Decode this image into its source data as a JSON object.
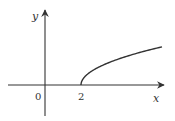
{
  "chart_data": {
    "type": "line",
    "title": "",
    "function": "y = sqrt(x - 2)",
    "xlabel": "x",
    "ylabel": "y",
    "x_ticks": [
      {
        "value": 0,
        "label": "0"
      },
      {
        "value": 2,
        "label": "2"
      }
    ],
    "domain_start": 2,
    "x_range_shown": [
      -2.2,
      6.6
    ],
    "points": [
      {
        "x": 2,
        "y": 0
      },
      {
        "x": 2.5,
        "y": 0.707
      },
      {
        "x": 3,
        "y": 1
      },
      {
        "x": 4,
        "y": 1.414
      },
      {
        "x": 5,
        "y": 1.732
      },
      {
        "x": 6,
        "y": 2
      },
      {
        "x": 6.5,
        "y": 2.121
      }
    ],
    "grid": false,
    "legend": null
  },
  "labels": {
    "origin": "0",
    "tick_2": "2",
    "x_axis": "x",
    "y_axis": "y"
  },
  "colors": {
    "axis": "#333333",
    "curve": "#333333"
  }
}
